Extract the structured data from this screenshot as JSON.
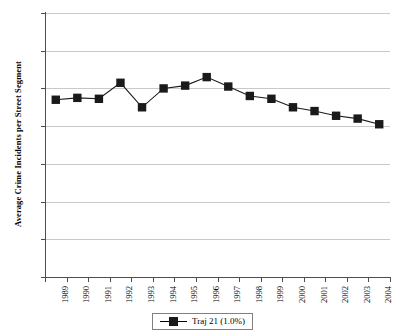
{
  "chart_data": {
    "type": "line",
    "title": "",
    "xlabel": "",
    "ylabel": "Average Crime Incidents per Street Segment",
    "ylim": [
      0,
      140
    ],
    "yticks": [
      0,
      20,
      40,
      60,
      80,
      100,
      120,
      140
    ],
    "grid": true,
    "legend_position": "bottom",
    "marker": "square",
    "marker_color": "#1a1a1a",
    "line_color": "#1a1a1a",
    "categories": [
      "1989",
      "1990",
      "1991",
      "1992",
      "1993",
      "1994",
      "1995",
      "1996",
      "1997",
      "1998",
      "1999",
      "2000",
      "2001",
      "2002",
      "2003",
      "2004"
    ],
    "series": [
      {
        "name": "Traj 21 (1.0%)",
        "values": [
          94,
          95,
          94.5,
          103,
          90,
          100,
          101.5,
          106,
          101,
          96,
          94.5,
          90,
          88,
          85.5,
          84,
          81
        ]
      }
    ]
  },
  "legend": {
    "entries": [
      {
        "label": "Traj 21 (1.0%)"
      }
    ]
  },
  "axes": {
    "y_title": "Average Crime Incidents per Street Segment"
  }
}
